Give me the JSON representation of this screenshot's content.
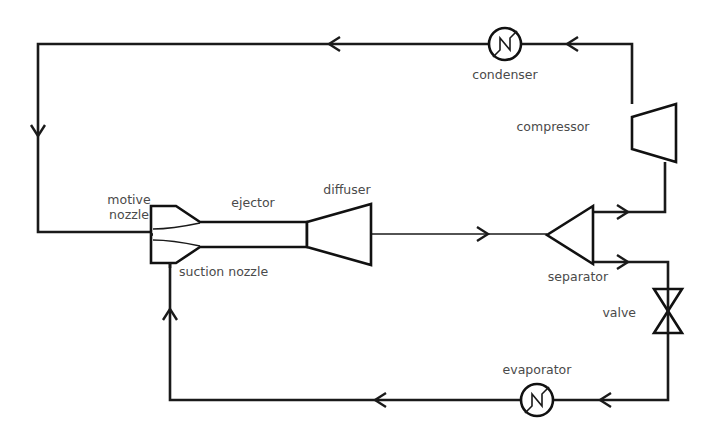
{
  "diagram": {
    "background_color": "#ffffff",
    "line_color": "#1a1a1a",
    "label_color": "#4a4a4a",
    "width": 708,
    "height": 431
  },
  "labels": {
    "condenser": "condenser",
    "compressor": "compressor",
    "separator": "separator",
    "valve": "valve",
    "evaporator": "evaporator",
    "ejector": "ejector",
    "diffuser": "diffuser",
    "motive_nozzle_line1": "motive",
    "motive_nozzle_line2": "nozzle",
    "suction_nozzle": "suction nozzle"
  },
  "components": [
    {
      "id": "condenser",
      "name": "condenser",
      "symbol": "circle-with-zigzag",
      "label": "condenser",
      "cx": 505,
      "cy": 44,
      "r": 16
    },
    {
      "id": "compressor",
      "name": "compressor",
      "symbol": "trapezoid",
      "label": "compressor",
      "x": 632,
      "y": 104,
      "width": 44,
      "height": 58
    },
    {
      "id": "separator",
      "name": "separator",
      "symbol": "triangle-pointing-left",
      "label": "separator",
      "x": 547,
      "y": 206,
      "width": 46,
      "height": 58
    },
    {
      "id": "valve",
      "name": "valve",
      "symbol": "bowtie-vertical",
      "label": "valve",
      "cx": 668,
      "cy": 311,
      "width": 28,
      "height": 44
    },
    {
      "id": "evaporator",
      "name": "evaporator",
      "symbol": "circle-with-zigzag",
      "label": "evaporator",
      "cx": 537,
      "cy": 400,
      "r": 16
    },
    {
      "id": "ejector",
      "name": "ejector",
      "symbol": "converging-mixing-diverging-duct",
      "label": "ejector"
    },
    {
      "id": "diffuser",
      "name": "diffuser",
      "symbol": "diverging-cone",
      "label": "diffuser"
    },
    {
      "id": "motive-nozzle",
      "name": "motive nozzle",
      "symbol": "converging-nozzle",
      "label": "motive nozzle"
    },
    {
      "id": "suction-nozzle",
      "name": "suction nozzle",
      "symbol": "side-inlet",
      "label": "suction nozzle"
    }
  ],
  "flow_arrows": [
    {
      "id": "top-to-condenser",
      "direction": "left",
      "x": 330,
      "y": 44
    },
    {
      "id": "compressor-to-condenser",
      "direction": "left",
      "x": 568,
      "y": 44
    },
    {
      "id": "condenser-to-motive-down",
      "direction": "down",
      "x": 38,
      "y": 135
    },
    {
      "id": "diffuser-to-separator",
      "direction": "right",
      "x": 487,
      "y": 234
    },
    {
      "id": "separator-vapor-out",
      "direction": "right",
      "x": 627,
      "y": 212
    },
    {
      "id": "separator-liquid-out",
      "direction": "right",
      "x": 627,
      "y": 262
    },
    {
      "id": "evaporator-inlet",
      "direction": "left",
      "x": 600,
      "y": 400
    },
    {
      "id": "evaporator-to-suction",
      "direction": "left",
      "x": 375,
      "y": 400
    },
    {
      "id": "suction-riser-up",
      "direction": "up",
      "x": 170,
      "y": 310
    }
  ],
  "label_positions": {
    "condenser": {
      "x": 505,
      "y": 79,
      "anchor": "middle"
    },
    "compressor": {
      "x": 553,
      "y": 131,
      "anchor": "middle"
    },
    "separator": {
      "x": 578,
      "y": 281,
      "anchor": "middle"
    },
    "valve": {
      "x": 636,
      "y": 317,
      "anchor": "end"
    },
    "evaporator": {
      "x": 537,
      "y": 374,
      "anchor": "middle"
    },
    "ejector": {
      "x": 253,
      "y": 203,
      "anchor": "middle"
    },
    "diffuser": {
      "x": 347,
      "y": 193,
      "anchor": "middle"
    },
    "motive1": {
      "x": 129,
      "y": 203,
      "anchor": "middle"
    },
    "motive2": {
      "x": 129,
      "y": 218,
      "anchor": "middle"
    },
    "suction": {
      "x": 179,
      "y": 275,
      "anchor": "start"
    }
  }
}
